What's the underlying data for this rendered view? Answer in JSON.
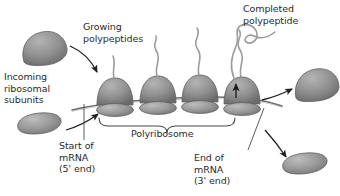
{
  "figure": {
    "background_color": "#ffffff",
    "width": 340,
    "height": 196
  },
  "labels": {
    "growing_polypeptides": "Growing\npolypeptides",
    "completed_polypeptide": "Completed\npolypeptide",
    "incoming_ribosomal_subunits": "Incoming\nribosomal\nsubunits",
    "start_of_mrna": "Start of\nmRNA\n(5' end)",
    "end_of_mrna": "End of\nmRNA\n(3' end)",
    "polyribosome": "Polyribosome"
  },
  "colors": {
    "text": "#2b2b2b",
    "ribosome_large_fill": "#8f8f8f",
    "ribosome_large_shade": "#6f6f6f",
    "ribosome_small_fill": "#9a9a9a",
    "ribosome_small_shade": "#777777",
    "outline": "#5a5a5a",
    "mrna_line": "#6e6e6e",
    "polypeptide_line": "#9b9b9b",
    "arrow": "#1f1f1f",
    "brace": "#4a4a4a"
  },
  "structures": {
    "mrna": {
      "name": "mRNA strand",
      "start_end_label": "5' end",
      "finish_end_label": "3' end"
    },
    "ribosomes_on_mrna": [
      {
        "index": 1,
        "polypeptide_length": "short"
      },
      {
        "index": 2,
        "polypeptide_length": "medium"
      },
      {
        "index": 3,
        "polypeptide_length": "long"
      },
      {
        "index": 4,
        "polypeptide_length": "longest"
      }
    ],
    "free_subunits": [
      {
        "position": "top-left",
        "type": "large subunit",
        "state": "incoming"
      },
      {
        "position": "bottom-left",
        "type": "small subunit",
        "state": "incoming"
      },
      {
        "position": "top-right",
        "type": "large subunit",
        "state": "released"
      },
      {
        "position": "bottom-right",
        "type": "small subunit",
        "state": "released"
      }
    ],
    "completed_polypeptide": {
      "state": "released",
      "shape": "free coiled chain"
    }
  }
}
